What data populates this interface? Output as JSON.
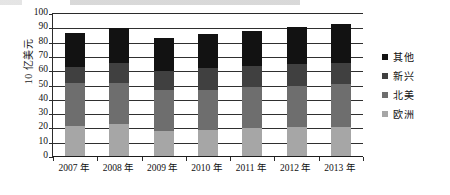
{
  "chart_data": {
    "type": "bar",
    "stacked": true,
    "title": "",
    "xlabel": "",
    "ylabel": "10 亿美元",
    "ylim": [
      0,
      100
    ],
    "ytick_step": 10,
    "grid": true,
    "legend_position": "right",
    "categories": [
      "2007 年",
      "2008 年",
      "2009 年",
      "2010 年",
      "2011 年",
      "2012 年",
      "2013 年"
    ],
    "ytick_labels": [
      "0",
      "10",
      "20",
      "30",
      "40",
      "50",
      "60",
      "70",
      "80",
      "90",
      "100"
    ],
    "series": [
      {
        "name": "欧洲",
        "color": "#a6a6a6",
        "values": [
          22,
          23,
          18,
          19,
          20,
          21,
          21
        ]
      },
      {
        "name": "北美",
        "color": "#6e6e6e",
        "values": [
          30,
          29,
          29,
          28,
          29,
          29,
          30
        ]
      },
      {
        "name": "新兴",
        "color": "#404040",
        "values": [
          11,
          14,
          13,
          15,
          15,
          15,
          15
        ]
      },
      {
        "name": "其他",
        "color": "#121212",
        "values": [
          24,
          24,
          23,
          24,
          24,
          26,
          27
        ]
      }
    ],
    "totals": [
      87,
      90,
      83,
      86,
      88,
      91,
      93
    ],
    "legend_order": [
      "其他",
      "新兴",
      "北美",
      "欧洲"
    ]
  }
}
